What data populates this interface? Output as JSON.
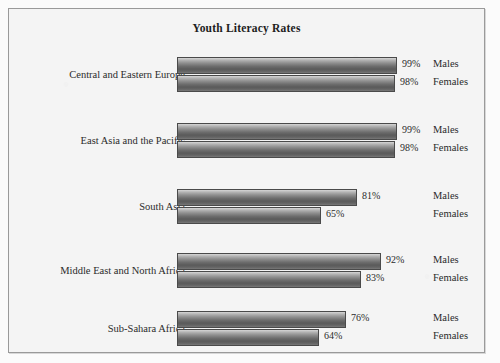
{
  "chart_data": {
    "type": "bar",
    "orientation": "horizontal",
    "title": "Youth Literacy Rates",
    "xlabel": "",
    "ylabel": "",
    "xlim": [
      0,
      100
    ],
    "grid": false,
    "legend_position": "right-inline",
    "value_suffix": "%",
    "categories": [
      "Central and Eastern Europe",
      "East Asia and the Pacific",
      "South Asia",
      "Middle East and North Africa",
      "Sub-Sahara Africa"
    ],
    "series": [
      {
        "name": "Males",
        "values": [
          99,
          99,
          81,
          92,
          76
        ]
      },
      {
        "name": "Females",
        "values": [
          98,
          98,
          65,
          83,
          64
        ]
      }
    ],
    "groups": [
      {
        "category": "Central and Eastern Europe",
        "bars": [
          {
            "series": "Males",
            "value": 99,
            "value_label": "99%"
          },
          {
            "series": "Females",
            "value": 98,
            "value_label": "98%"
          }
        ]
      },
      {
        "category": "East Asia and the Pacific",
        "bars": [
          {
            "series": "Males",
            "value": 99,
            "value_label": "99%"
          },
          {
            "series": "Females",
            "value": 98,
            "value_label": "98%"
          }
        ]
      },
      {
        "category": "South Asia",
        "bars": [
          {
            "series": "Males",
            "value": 81,
            "value_label": "81%"
          },
          {
            "series": "Females",
            "value": 65,
            "value_label": "65%"
          }
        ]
      },
      {
        "category": "Middle East and North Africa",
        "bars": [
          {
            "series": "Males",
            "value": 92,
            "value_label": "92%"
          },
          {
            "series": "Females",
            "value": 83,
            "value_label": "83%"
          }
        ]
      },
      {
        "category": "Sub-Sahara Africa",
        "bars": [
          {
            "series": "Males",
            "value": 76,
            "value_label": "76%"
          },
          {
            "series": "Females",
            "value": 64,
            "value_label": "64%"
          }
        ]
      }
    ],
    "colors": {
      "bar_light": "#d6d6d6",
      "bar_dark": "#5a5a5a",
      "bar_outline": "#4a4a4a",
      "text": "#2b2b2b",
      "background": "#f4f4f4",
      "frame": "#9a9a9a"
    }
  },
  "layout": {
    "bar_origin_x": 168,
    "bar_max_width": 222,
    "bar_height": 17,
    "group_tops": [
      48,
      114,
      180,
      244,
      302
    ]
  }
}
